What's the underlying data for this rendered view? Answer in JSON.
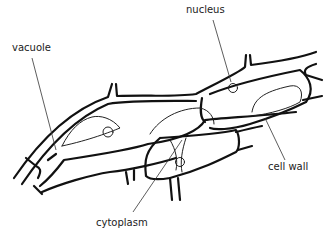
{
  "diagram": {
    "labels": {
      "vacuole": "vacuole",
      "nucleus": "nucleus",
      "cell_wall": "cell wall",
      "cytoplasm": "cytoplasm"
    },
    "colors": {
      "line": "#111111",
      "text": "#222222",
      "background": "#ffffff"
    }
  }
}
